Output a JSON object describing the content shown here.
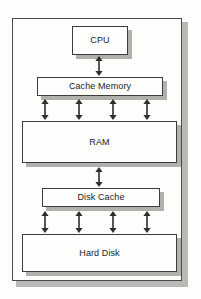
{
  "diagram": {
    "type": "block-diagram",
    "background_color": "#fdfdfc",
    "box_border_color": "#3d3d3b",
    "shadow_color": "#b0b0ad",
    "frame_border_color": "#4a4a48",
    "nodes": [
      {
        "id": "cpu",
        "label": "CPU",
        "x": 72,
        "y": 26,
        "width": 56,
        "height": 29
      },
      {
        "id": "cache-memory",
        "label": "Cache Memory",
        "x": 37,
        "y": 77,
        "width": 126,
        "height": 19
      },
      {
        "id": "ram",
        "label": "RAM",
        "x": 22,
        "y": 121,
        "width": 155,
        "height": 42
      },
      {
        "id": "disk-cache",
        "label": "Disk Cache",
        "x": 42,
        "y": 188,
        "width": 118,
        "height": 19
      },
      {
        "id": "hard-disk",
        "label": "Hard Disk",
        "x": 22,
        "y": 234,
        "width": 155,
        "height": 38
      }
    ],
    "connectors": [
      {
        "id": "cpu-to-cache-memory",
        "from": "cpu",
        "to": "cache-memory",
        "style": "double-headed",
        "count": 1,
        "x_positions": [
          99
        ],
        "y_top": 57,
        "y_bottom": 75
      },
      {
        "id": "cache-memory-to-ram",
        "from": "cache-memory",
        "to": "ram",
        "style": "double-headed",
        "count": 4,
        "x_positions": [
          45,
          79,
          113,
          147
        ],
        "y_top": 100,
        "y_bottom": 119
      },
      {
        "id": "ram-to-disk-cache",
        "from": "ram",
        "to": "disk-cache",
        "style": "double-headed",
        "count": 1,
        "x_positions": [
          99
        ],
        "y_top": 168,
        "y_bottom": 186
      },
      {
        "id": "disk-cache-to-hard-disk",
        "from": "disk-cache",
        "to": "hard-disk",
        "style": "double-headed",
        "count": 4,
        "x_positions": [
          45,
          79,
          113,
          147
        ],
        "y_top": 212,
        "y_bottom": 232
      }
    ]
  }
}
